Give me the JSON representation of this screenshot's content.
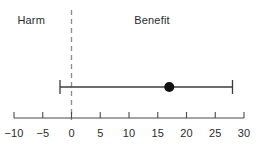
{
  "chart_data": {
    "type": "scatter",
    "title": "",
    "subtitle": "",
    "xlabel": "",
    "ylabel": "",
    "xlim": [
      -10,
      30
    ],
    "ylim": [
      0,
      1
    ],
    "grid": false,
    "legend": "none",
    "orientation": "horizontal",
    "x_ticks": [
      -10,
      -5,
      0,
      5,
      10,
      15,
      20,
      25,
      30
    ],
    "x_tick_labels": [
      "−10",
      "−5",
      "0",
      "5",
      "10",
      "15",
      "20",
      "25",
      "30"
    ],
    "reference_line": {
      "value": 0,
      "style": "dashed",
      "orientation": "vertical",
      "color": "#8c8c8c"
    },
    "region_labels": [
      {
        "text": "Harm",
        "center_value": -7,
        "side": "left"
      },
      {
        "text": "Benefit",
        "center_value": 14,
        "side": "right"
      }
    ],
    "series": [
      {
        "name": "Treatment effect",
        "marker": "filled-circle",
        "marker_color": "#111111",
        "line_color": "#3c3c3c",
        "points": [
          {
            "estimate": 17,
            "ci_low": -2,
            "ci_high": 28,
            "y": 0.5
          }
        ]
      }
    ],
    "axis_color": "#4a4a4a",
    "text_color": "#2b2b2b",
    "background": "#ffffff"
  },
  "geometry": {
    "axis_y": 118,
    "axis_x_start": 14,
    "axis_x_end": 244,
    "px_per_unit": 5.75,
    "zero_x": 71.5,
    "bar_y": 87,
    "tick_top": 112,
    "tick_bottom": 118,
    "dash_top": 10,
    "dash_bottom": 120,
    "cap_half_height": 7,
    "dot_radius": 5,
    "region_label_y": 14,
    "tick_label_y": 127
  }
}
